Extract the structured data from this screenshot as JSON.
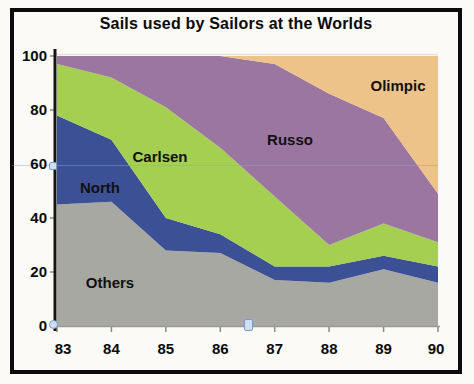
{
  "chart_data": {
    "type": "area",
    "stacked": true,
    "title": "Sails used by Sailors at the Worlds",
    "categories": [
      "83",
      "84",
      "85",
      "86",
      "87",
      "88",
      "89",
      "90"
    ],
    "xlabel": "",
    "ylabel": "",
    "ylim": [
      0,
      100
    ],
    "yticks": [
      0,
      20,
      40,
      60,
      80,
      100
    ],
    "grid": "top line only",
    "legend_position": "labels inside areas",
    "series": [
      {
        "name": "Others",
        "color": "#a7a8a2",
        "values": [
          45,
          46,
          28,
          27,
          17,
          16,
          21,
          16
        ]
      },
      {
        "name": "North",
        "color": "#3c5095",
        "values": [
          33,
          23,
          12,
          7,
          5,
          6,
          5,
          6
        ]
      },
      {
        "name": "Carlsen",
        "color": "#a5cf51",
        "values": [
          19,
          23,
          41,
          32,
          26,
          8,
          12,
          9
        ]
      },
      {
        "name": "Russo",
        "color": "#9a76a0",
        "values": [
          3,
          8,
          19,
          34,
          49,
          56,
          39,
          18
        ]
      },
      {
        "name": "Olimpic",
        "color": "#eec389",
        "values": [
          0,
          0,
          0,
          0,
          3,
          14,
          23,
          51
        ]
      }
    ]
  },
  "decorations": {
    "axis_color": "#141414",
    "x_axis_color": "#9a9a94",
    "tick_color": "#8c8c86",
    "top_gridline_color": "#e2e1da",
    "guide_line_color": "#7fa6d4",
    "handle_fill": "#cfe0f0",
    "handle_border": "#7a9cc4"
  }
}
